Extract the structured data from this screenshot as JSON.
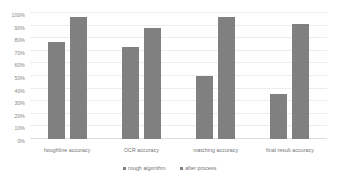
{
  "chart_data": {
    "type": "bar",
    "title": "",
    "xlabel": "",
    "ylabel": "",
    "categories": [
      "houghline accuracy",
      "OCR accuracy",
      "matching accuracy",
      "final result accuracy"
    ],
    "series": [
      {
        "name": "rough algorithm",
        "values": [
          77,
          73,
          50,
          36
        ],
        "color": "#808080"
      },
      {
        "name": "after process",
        "values": [
          97,
          88,
          97,
          91
        ],
        "color": "#808080"
      }
    ],
    "ylim": [
      0,
      100
    ],
    "y_ticks": [
      0,
      10,
      20,
      30,
      40,
      50,
      60,
      70,
      80,
      90,
      100
    ],
    "y_tick_labels": [
      "0%",
      "10%",
      "20%",
      "30%",
      "40%",
      "50%",
      "60%",
      "70%",
      "80%",
      "90%",
      "100%"
    ],
    "grid": true,
    "legend_position": "bottom",
    "background_color": "#ffffff",
    "gridline_color": "#ececed"
  }
}
